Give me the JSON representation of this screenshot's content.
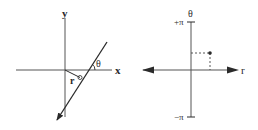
{
  "left_panel": {
    "y_axis_label": "y",
    "x_axis_label": "x",
    "angle_label": "θ",
    "distance_label": "r"
  },
  "right_panel": {
    "vertical_axis_label": "θ",
    "horizontal_axis_label": "r",
    "top_tick_label": "+π",
    "bottom_tick_label": "−π"
  },
  "colors": {
    "ink": "#2a2a2a",
    "background": "#ffffff"
  }
}
